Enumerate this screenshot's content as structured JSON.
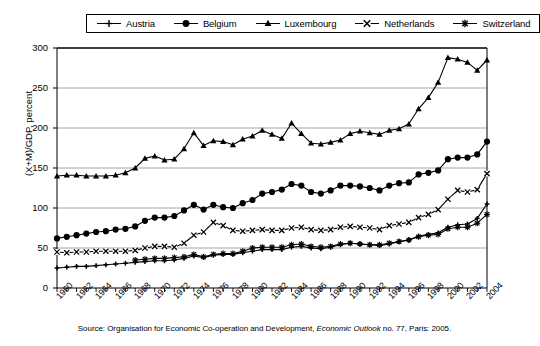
{
  "legend": {
    "position": "top",
    "bordered": true,
    "entries": [
      {
        "label": "Austria",
        "marker": "plus-small",
        "icon": "austria-legend-marker"
      },
      {
        "label": "Belgium",
        "marker": "circle-filled",
        "icon": "belgium-legend-marker"
      },
      {
        "label": "Luxembourg",
        "marker": "triangle",
        "icon": "luxembourg-legend-marker"
      },
      {
        "label": "Netherlands",
        "marker": "cross-x",
        "icon": "netherlands-legend-marker"
      },
      {
        "label": "Switzerland",
        "marker": "asterisk",
        "icon": "switzerland-legend-marker"
      }
    ]
  },
  "source": {
    "prefix": "Source: Organisation for Economic Co-operation and Development, ",
    "italic": "Economic Outlook",
    "suffix": " no. 77, Paris: 2005."
  },
  "chart_data": {
    "type": "line",
    "title": "",
    "xlabel": "",
    "ylabel": "(X+M)/GDP, percent",
    "ylim": [
      0,
      300
    ],
    "ytick_step": 50,
    "yticks": [
      0,
      50,
      100,
      150,
      200,
      250,
      300
    ],
    "xlim": [
      1960,
      2004
    ],
    "x": [
      1960,
      1961,
      1962,
      1963,
      1964,
      1965,
      1966,
      1967,
      1968,
      1969,
      1970,
      1971,
      1972,
      1973,
      1974,
      1975,
      1976,
      1977,
      1978,
      1979,
      1980,
      1981,
      1982,
      1983,
      1984,
      1985,
      1986,
      1987,
      1988,
      1989,
      1990,
      1991,
      1992,
      1993,
      1994,
      1995,
      1996,
      1997,
      1998,
      1999,
      2000,
      2001,
      2002,
      2003,
      2004
    ],
    "xtick_labels": [
      "1960",
      "1962",
      "1964",
      "1966",
      "1968",
      "1970",
      "1972",
      "1974",
      "1976",
      "1978",
      "1980",
      "1982",
      "1984",
      "1986",
      "1988",
      "1990",
      "1992",
      "1994",
      "1996",
      "1998",
      "2000",
      "2002",
      "2004"
    ],
    "xtick_label_step": 2,
    "minor_ticks": "every year",
    "grid": "horizontal",
    "legend_position": "top",
    "series": [
      {
        "name": "Austria",
        "marker": "plus-small",
        "color": "#000000",
        "values": [
          25,
          26,
          27,
          27,
          28,
          29,
          30,
          31,
          32,
          33,
          34,
          34,
          35,
          37,
          40,
          38,
          41,
          42,
          42,
          44,
          46,
          48,
          48,
          48,
          51,
          52,
          50,
          49,
          51,
          54,
          56,
          55,
          54,
          53,
          55,
          58,
          60,
          65,
          67,
          69,
          76,
          79,
          80,
          87,
          105
        ]
      },
      {
        "name": "Belgium",
        "marker": "circle-filled",
        "color": "#000000",
        "values": [
          62,
          64,
          66,
          68,
          70,
          71,
          73,
          74,
          77,
          84,
          88,
          88,
          90,
          97,
          104,
          98,
          104,
          101,
          100,
          106,
          110,
          118,
          120,
          123,
          130,
          128,
          120,
          118,
          122,
          128,
          128,
          127,
          125,
          122,
          128,
          131,
          132,
          142,
          144,
          147,
          161,
          163,
          163,
          167,
          183
        ]
      },
      {
        "name": "Luxembourg",
        "marker": "triangle",
        "color": "#000000",
        "values": [
          140,
          141,
          141,
          140,
          140,
          140,
          141,
          144,
          150,
          162,
          165,
          160,
          161,
          174,
          194,
          178,
          184,
          183,
          179,
          186,
          190,
          197,
          192,
          187,
          206,
          193,
          181,
          180,
          182,
          185,
          193,
          196,
          194,
          192,
          197,
          199,
          205,
          224,
          238,
          257,
          288,
          286,
          282,
          272,
          285
        ]
      },
      {
        "name": "Netherlands",
        "marker": "cross-x",
        "color": "#000000",
        "values": [
          45,
          44,
          45,
          45,
          46,
          46,
          46,
          46,
          47,
          50,
          52,
          52,
          51,
          56,
          66,
          70,
          82,
          78,
          72,
          71,
          72,
          73,
          72,
          72,
          75,
          76,
          73,
          72,
          73,
          76,
          77,
          76,
          75,
          73,
          78,
          80,
          82,
          88,
          92,
          98,
          111,
          122,
          120,
          123,
          143
        ]
      },
      {
        "name": "Switzerland",
        "marker": "asterisk",
        "color": "#000000",
        "values": [
          null,
          null,
          null,
          null,
          null,
          null,
          null,
          null,
          35,
          36,
          37,
          37,
          38,
          39,
          42,
          39,
          42,
          43,
          43,
          46,
          50,
          51,
          51,
          51,
          54,
          55,
          52,
          51,
          52,
          55,
          56,
          55,
          54,
          54,
          56,
          58,
          60,
          64,
          66,
          67,
          74,
          76,
          76,
          81,
          92
        ]
      }
    ]
  }
}
